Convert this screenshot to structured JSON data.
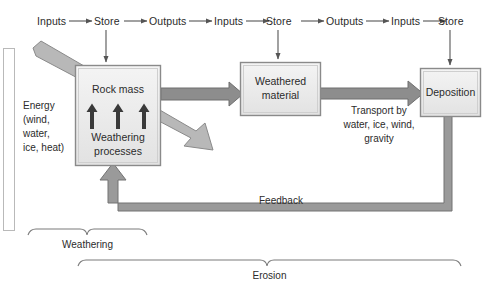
{
  "diagram": {
    "colors": {
      "box_fill": "#ececec",
      "box_border": "#8a8a8a",
      "thick_arrow": "#8d8d8d",
      "thick_arrow_border": "#6f6f6f",
      "thin_arrow": "#555555",
      "text": "#2b2b2b",
      "background": "#ffffff"
    },
    "flow_row": {
      "name": "systems-flow-row",
      "steps": [
        {
          "label": "Inputs"
        },
        {
          "label": "Store"
        },
        {
          "label": "Outputs"
        },
        {
          "label": "Inputs"
        },
        {
          "label": "Store"
        },
        {
          "label": "Outputs"
        },
        {
          "label": "Inputs"
        },
        {
          "label": "Store"
        }
      ]
    },
    "boxes": [
      {
        "id": "rock-mass",
        "line1": "Rock mass",
        "line2": "Weathering",
        "line3": "processes"
      },
      {
        "id": "weathered-material",
        "line1": "Weathered",
        "line2": "material"
      },
      {
        "id": "deposition",
        "line1": "Deposition"
      }
    ],
    "labels": {
      "energy": "Energy\n(wind,\nwater,\nice, heat)",
      "energy_line1": "Energy",
      "energy_line2": "(wind,",
      "energy_line3": "water,",
      "energy_line4": "ice, heat)",
      "transport_line1": "Transport by",
      "transport_line2": "water, ice, wind,",
      "transport_line3": "gravity",
      "feedback": "Feedback"
    },
    "braces": [
      {
        "id": "weathering-brace",
        "label": "Weathering"
      },
      {
        "id": "erosion-brace",
        "label": "Erosion"
      }
    ]
  }
}
